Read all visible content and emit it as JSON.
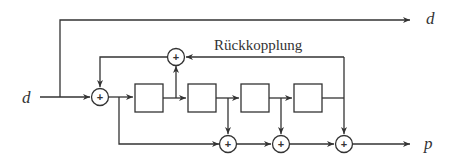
{
  "diagram": {
    "type": "block-diagram",
    "labels": {
      "input": "d",
      "top_output": "d",
      "feedback": "Rückkopplung",
      "output": "p"
    },
    "adder_symbol": "+",
    "blocks": [
      {
        "id": "register-1"
      },
      {
        "id": "register-2"
      },
      {
        "id": "register-3"
      },
      {
        "id": "register-4"
      }
    ],
    "adders": [
      {
        "id": "input-adder"
      },
      {
        "id": "feedback-adder"
      },
      {
        "id": "output-adder-1"
      },
      {
        "id": "output-adder-2"
      },
      {
        "id": "output-adder-3"
      }
    ],
    "colors": {
      "stroke": "#333333",
      "background": "#ffffff"
    }
  }
}
